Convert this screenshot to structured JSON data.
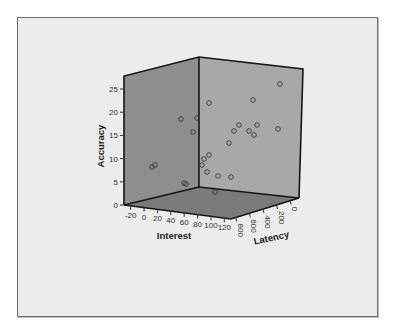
{
  "chart_data": {
    "type": "scatter3d",
    "title": "",
    "axes": {
      "x": {
        "label": "Interest",
        "ticks": [
          -20,
          0,
          20,
          40,
          60,
          80,
          100,
          120
        ],
        "range": [
          -30,
          130
        ]
      },
      "y": {
        "label": "Accuracy",
        "ticks": [
          0,
          5,
          10,
          15,
          20,
          25
        ],
        "range": [
          0,
          27
        ]
      },
      "z": {
        "label": "Latency",
        "ticks": [
          800,
          600,
          400,
          200,
          0
        ],
        "range": [
          0,
          900
        ]
      }
    },
    "grid": false,
    "legend": null,
    "colors": {
      "frame_bg": "#ececec",
      "back_left_wall": "#8e8e8e",
      "back_right_wall": "#a8a8a8",
      "floor": "#7a7a7a",
      "edge": "#151515",
      "marker": "#3a3a3a"
    },
    "points_screen": [
      [
        279,
        83
      ],
      [
        208,
        102
      ],
      [
        252,
        99
      ],
      [
        180,
        118
      ],
      [
        196,
        117
      ],
      [
        192,
        131
      ],
      [
        238,
        124
      ],
      [
        233,
        130
      ],
      [
        256,
        124
      ],
      [
        248,
        130
      ],
      [
        253,
        134
      ],
      [
        277,
        128
      ],
      [
        228,
        142
      ],
      [
        208,
        154
      ],
      [
        203,
        158
      ],
      [
        201,
        164
      ],
      [
        151,
        166
      ],
      [
        154,
        164
      ],
      [
        206,
        171
      ],
      [
        217,
        175
      ],
      [
        230,
        176
      ],
      [
        183,
        182
      ],
      [
        185,
        183
      ],
      [
        214,
        191
      ]
    ],
    "approx_accuracy_values": [
      26,
      22,
      23,
      18.5,
      18.5,
      15.8,
      17.2,
      16,
      17.2,
      16,
      15,
      16.3,
      13.5,
      10.7,
      10,
      8.8,
      8.2,
      8.7,
      7.3,
      6.4,
      6.1,
      5,
      4.6,
      3
    ]
  }
}
